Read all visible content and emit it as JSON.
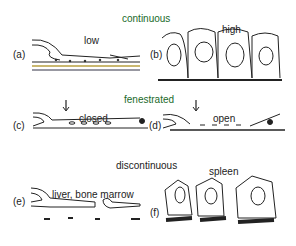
{
  "diagram": {
    "sections": [
      {
        "title": "continuous",
        "panels": [
          {
            "id": "(a)",
            "label": "low"
          },
          {
            "id": "(b)",
            "label": "high"
          }
        ]
      },
      {
        "title": "fenestrated",
        "panels": [
          {
            "id": "(c)",
            "label": "closed"
          },
          {
            "id": "(d)",
            "label": "open"
          }
        ]
      },
      {
        "title": "discontinuous",
        "panels": [
          {
            "id": "(e)",
            "label": "liver, bone marrow"
          },
          {
            "id": "(f)",
            "label": "spleen"
          }
        ]
      }
    ],
    "colors": {
      "title": "#1a6a2a",
      "line": "#222222",
      "accent": "#b8a040"
    }
  }
}
